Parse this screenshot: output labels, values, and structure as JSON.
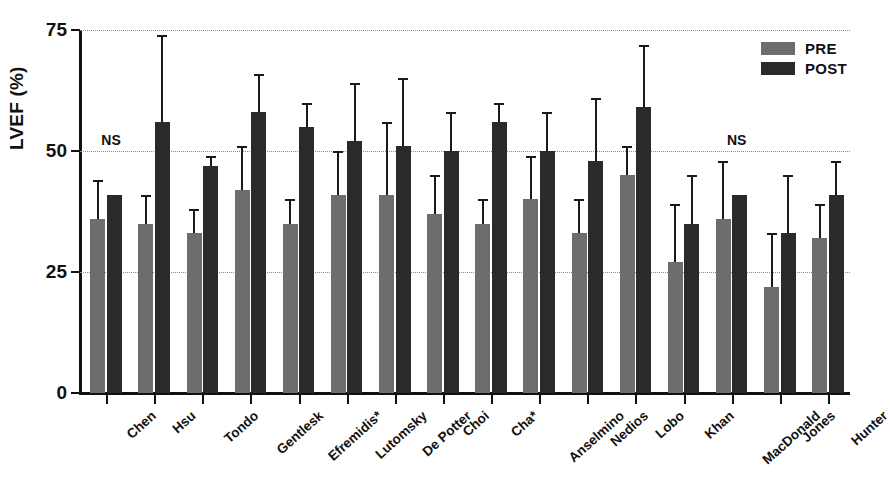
{
  "chart_data": {
    "type": "bar",
    "title": "",
    "subtitle": "",
    "xlabel": "",
    "ylabel": "LVEF (%)",
    "ylim": [
      0,
      75
    ],
    "yticks": [
      0,
      25,
      50,
      75
    ],
    "ytick_labels": [
      "0",
      "25",
      "50",
      "75"
    ],
    "grid": "horizontal-dotted",
    "legend_position": "top-right",
    "categories": [
      "Chen",
      "Hsu",
      "Tondo",
      "Gentlesk",
      "Efremidis*",
      "Lutomsky",
      "De Potter",
      "Choi",
      "Cha*",
      "Anselmino",
      "Nedios",
      "Lobo",
      "Khan",
      "MacDonald",
      "Jones",
      "Hunter"
    ],
    "series": [
      {
        "name": "PRE",
        "color": "#6d6d6d",
        "values": [
          36,
          35,
          33,
          42,
          35,
          41,
          41,
          37,
          35,
          40,
          33,
          45,
          27,
          36,
          22,
          32
        ],
        "errors_upper": [
          44,
          41,
          38,
          51,
          40,
          50,
          56,
          45,
          40,
          49,
          40,
          51,
          39,
          48,
          33,
          39
        ]
      },
      {
        "name": "POST",
        "color": "#2a2a2a",
        "values": [
          41,
          56,
          47,
          58,
          55,
          52,
          51,
          50,
          56,
          50,
          48,
          59,
          35,
          41,
          33,
          41
        ],
        "errors_upper": [
          41,
          74,
          49,
          66,
          60,
          64,
          65,
          58,
          60,
          58,
          61,
          72,
          45,
          41,
          45,
          48
        ]
      }
    ],
    "annotations": [
      {
        "text": "NS",
        "x_category": "Chen",
        "y": 52
      },
      {
        "text": "NS",
        "x_category": "MacDonald",
        "y": 52
      }
    ],
    "legend": [
      {
        "label": "PRE",
        "color": "#6d6d6d"
      },
      {
        "label": "POST",
        "color": "#2a2a2a"
      }
    ]
  }
}
